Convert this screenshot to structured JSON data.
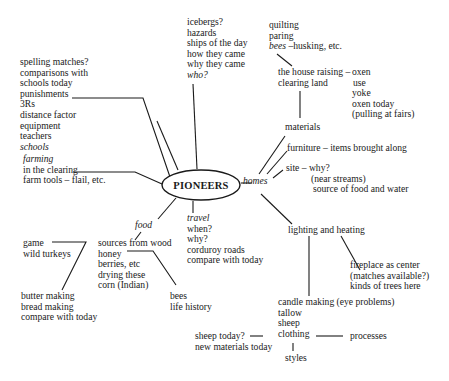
{
  "center": {
    "label": "PIONEERS"
  },
  "schools": {
    "items": [
      "spelling matches?",
      "comparisons with",
      "schools today",
      "punishments",
      "3Rs",
      "distance factor",
      "equipment",
      "teachers"
    ],
    "label": "schools"
  },
  "farming": {
    "label": "farming",
    "items": [
      "in the clearing",
      "farm tools – flail, etc."
    ]
  },
  "who": {
    "items": [
      "icebergs?",
      "hazards",
      "ships of the day",
      "how they came",
      "why they came"
    ],
    "label": "who?"
  },
  "bees_group": {
    "items": [
      "quilting",
      "paring"
    ],
    "bees_label": "bees",
    "bees_rest": " –husking, etc."
  },
  "house": {
    "items": [
      "the house raising –",
      "clearing land"
    ]
  },
  "oxen": {
    "items": [
      "oxen",
      "use",
      "yoke",
      "oxen today",
      "(pulling at fairs)"
    ]
  },
  "homes": {
    "label": "homes",
    "materials": "materials",
    "furniture": "furniture – items brought along",
    "site": [
      "site – why?",
      "(near streams)",
      "source of food and water"
    ],
    "lighting": "lighting and heating",
    "fireplace": [
      "fireplace as center",
      "(matches available?)",
      "kinds of trees here"
    ]
  },
  "candle": {
    "items": [
      "candle making (eye problems)",
      "tallow",
      "sheep",
      "clothing"
    ],
    "styles": "styles",
    "processes": "processes",
    "sheep_today": [
      "sheep today?",
      "new materials today"
    ]
  },
  "food": {
    "label": "food",
    "sources": [
      "sources from wood",
      "honey",
      "berries, etc",
      "drying these",
      "corn (Indian)"
    ],
    "game": [
      "game",
      "wild turkeys"
    ],
    "butter": [
      "butter making",
      "bread making",
      "compare with today"
    ],
    "bees": [
      "bees",
      "life history"
    ]
  },
  "travel": {
    "label": "travel",
    "items": [
      "when?",
      "why?",
      "corduroy roads",
      "compare with today"
    ]
  }
}
